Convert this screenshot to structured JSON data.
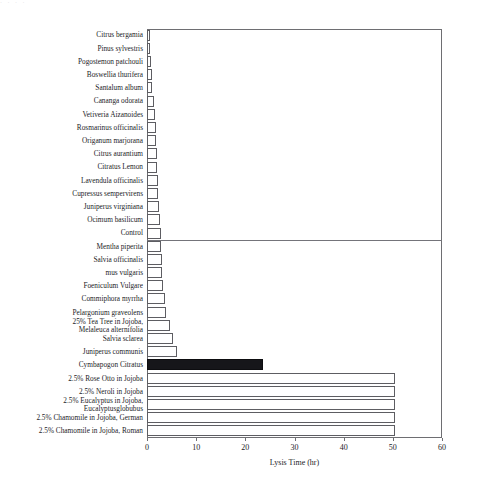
{
  "figure": {
    "top_artifact_text": "·  ·   ·   ·",
    "background_color": "#ffffff",
    "bar_outline_color": "#5d5d62",
    "bar_fill_color": "#ffffff",
    "highlight_bar_color": "#16161a",
    "axis_color": "#6e6e72",
    "divider_after_category": "Control"
  },
  "chart_data": {
    "type": "bar",
    "orientation": "horizontal",
    "title": "",
    "subtitle": "",
    "xlabel": "Lysis Time (hr)",
    "ylabel": "",
    "xlim": [
      0,
      60
    ],
    "ylim": null,
    "xticks": [
      0,
      10,
      20,
      30,
      40,
      50,
      60
    ],
    "xtick_labels": [
      "0",
      "10",
      "20",
      "30",
      "40",
      "50",
      "60"
    ],
    "grid": false,
    "legend": null,
    "legend_position": "none",
    "units": "hr",
    "highlight_category": "Cymbapogon Citratus",
    "categories": [
      "Citrus bergamia",
      "Pinus sylvestris",
      "Pogostemon patchouli",
      "Boswellia thurifera",
      "Santalum album",
      "Cananga odorata",
      "Vetiveria Aizanoides",
      "Rosmarinus officinalis",
      "Origanum marjorana",
      "Citrus aurantium",
      "Citratus Lemon",
      "Lavendula officinalis",
      "Cupressus sempervirens",
      "Juniperus virginiana",
      "Ocimum basilicum",
      "Control",
      "Mentha piperita",
      "Salvia officinalis",
      "mus vulgaris",
      "Foeniculum Vulgare",
      "Commiphora myrrha",
      "Pelargonium graveolens",
      "25% Tea Tree in Jojoba,\nMelaleuca alternifolia",
      "Salvia sclarea",
      "Juniperus communis",
      "Cymbapogon Citratus",
      "2.5% Rose Otto in Jojoba",
      "2.5% Neroli in Jojoba",
      "2.5% Eucalyptus in Jojoba,\nEucalyptusglobubus",
      "2.5% Chamomile in Jojoba, German",
      "2.5% Chamomile in Jojoba, Roman"
    ],
    "values": [
      0.5,
      0.6,
      0.9,
      1.0,
      1.1,
      1.5,
      1.6,
      1.8,
      1.9,
      2.0,
      2.1,
      2.2,
      2.3,
      2.5,
      2.7,
      2.8,
      2.9,
      3.0,
      3.1,
      3.3,
      3.6,
      3.9,
      4.6,
      5.3,
      6.2,
      23.6,
      50.5,
      50.5,
      50.5,
      50.5,
      50.5
    ]
  }
}
